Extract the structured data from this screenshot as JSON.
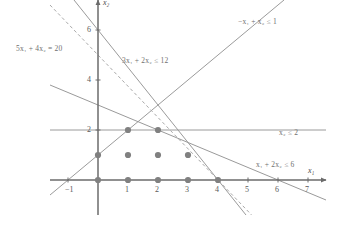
{
  "chart_data": {
    "type": "scatter",
    "title": "",
    "xlabel": "x1",
    "ylabel": "x2",
    "xlim": [
      -1.6,
      7.6
    ],
    "ylim": [
      -1.4,
      7.2
    ],
    "grid": false,
    "legend_position": "inline-annotations",
    "origin_px": [
      98,
      180
    ],
    "unit_px": [
      30,
      25
    ],
    "axis_labels": {
      "x": "x₁",
      "y": "x₂"
    },
    "x_ticks": [
      -1,
      1,
      2,
      3,
      4,
      5,
      6,
      7
    ],
    "x_tick_labels": [
      "−1",
      "1",
      "2",
      "3",
      "4",
      "5",
      "6",
      "7"
    ],
    "y_ticks": [
      2,
      4,
      6
    ],
    "y_tick_labels": [
      "2",
      "4",
      "6"
    ],
    "points_label": "feasible integer points",
    "points": [
      [
        0,
        0
      ],
      [
        1,
        0
      ],
      [
        2,
        0
      ],
      [
        3,
        0
      ],
      [
        4,
        0
      ],
      [
        0,
        1
      ],
      [
        1,
        1
      ],
      [
        2,
        1
      ],
      [
        3,
        1
      ],
      [
        1,
        2
      ],
      [
        2,
        2
      ]
    ],
    "point_color": "#808080",
    "line_color": "#9a9a9a",
    "axis_color": "#6b6b6b",
    "dashed_color": "#a9a9a9",
    "constraints": [
      {
        "id": "c1",
        "text": "3x₁ + 2x₂ ≤ 12",
        "coef": [
          3,
          2
        ],
        "rhs": 12,
        "style": "solid",
        "label_px": [
          122,
          56
        ]
      },
      {
        "id": "c2",
        "text": "x₂ ≤ 2",
        "coef": [
          0,
          1
        ],
        "rhs": 2,
        "style": "solid",
        "label_px": [
          279,
          128
        ]
      },
      {
        "id": "c3",
        "text": "x₁ + 2x₂ ≤ 6",
        "coef": [
          1,
          2
        ],
        "rhs": 6,
        "style": "solid",
        "label_px": [
          256,
          160
        ]
      },
      {
        "id": "c4",
        "text": "−x₁ + x₂ ≤ 1",
        "coef": [
          -1,
          1
        ],
        "rhs": 1,
        "style": "solid",
        "label_px": [
          238,
          17
        ]
      }
    ],
    "objective": {
      "id": "obj",
      "text": "5x₁ + 4x₂ = 20",
      "coef": [
        5,
        4
      ],
      "rhs": 20,
      "style": "dashed",
      "label_px": [
        16,
        44
      ]
    }
  }
}
